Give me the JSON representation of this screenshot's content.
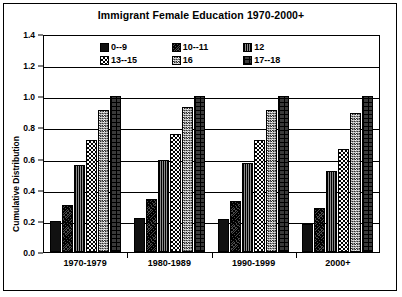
{
  "chart_data": {
    "type": "bar",
    "title": "Immigrant Female Education 1970-2000+",
    "xlabel": "",
    "ylabel": "Cumulative Distribution",
    "ylim": [
      0.0,
      1.4
    ],
    "ytick_labels": [
      "0.0",
      "0.2",
      "0.4",
      "0.6",
      "0.8",
      "1.0",
      "1.2",
      "1.4"
    ],
    "ytick_values": [
      0.0,
      0.2,
      0.4,
      0.6,
      0.8,
      1.0,
      1.2,
      1.4
    ],
    "grid": true,
    "legend_position": "top-inside",
    "categories": [
      "1970-1979",
      "1980-1989",
      "1990-1999",
      "2000+"
    ],
    "series": [
      {
        "name": "0--9",
        "pattern": "solid-black",
        "values": [
          0.2,
          0.22,
          0.21,
          0.18
        ]
      },
      {
        "name": "10--11",
        "pattern": "diagonal-hatch",
        "values": [
          0.3,
          0.34,
          0.33,
          0.28
        ]
      },
      {
        "name": "12",
        "pattern": "dense-dark-dots",
        "values": [
          0.56,
          0.59,
          0.57,
          0.52
        ]
      },
      {
        "name": "13--15",
        "pattern": "checkerboard",
        "values": [
          0.72,
          0.76,
          0.72,
          0.66
        ]
      },
      {
        "name": "16",
        "pattern": "fine-checker",
        "values": [
          0.91,
          0.93,
          0.91,
          0.89
        ]
      },
      {
        "name": "17--18",
        "pattern": "brick",
        "values": [
          1.0,
          1.0,
          1.0,
          1.0
        ]
      }
    ]
  }
}
